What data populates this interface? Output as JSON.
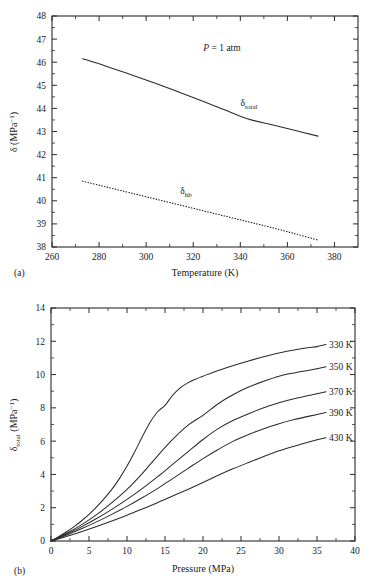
{
  "figure": {
    "background": "#ffffff",
    "ink_color": "#2b2b2b"
  },
  "panel_a": {
    "tag": "(a)",
    "annotation": "= 1 atm",
    "annotation_symbol": "P",
    "xlabel": "Temperature (K)",
    "ylabel_main": "δ (MPa",
    "ylabel_sup": "−1",
    "ylabel_close": ")",
    "xticks": [
      "260",
      "280",
      "300",
      "320",
      "340",
      "360",
      "380"
    ],
    "yticks": [
      "38",
      "39",
      "40",
      "41",
      "42",
      "43",
      "44",
      "45",
      "46",
      "47",
      "48"
    ],
    "curve_labels": [
      {
        "base": "δ",
        "sub": "total"
      },
      {
        "base": "δ",
        "sub": "hb"
      }
    ]
  },
  "panel_b": {
    "tag": "(b)",
    "xlabel": "Pressure (MPa)",
    "ylabel_base": "δ",
    "ylabel_sub": "total",
    "ylabel_unit": " (MPa",
    "ylabel_sup": "−1",
    "ylabel_close": ")",
    "xticks": [
      "0",
      "5",
      "10",
      "15",
      "20",
      "25",
      "30",
      "35",
      "40"
    ],
    "yticks": [
      "0",
      "2",
      "4",
      "6",
      "8",
      "10",
      "12",
      "14"
    ],
    "series_labels": [
      "330 K",
      "350 K",
      "370 K",
      "390 K",
      "430 K"
    ]
  },
  "chart_data": [
    {
      "type": "line",
      "panel": "a",
      "title": "",
      "xlabel": "Temperature (K)",
      "ylabel": "δ (MPa⁻¹)",
      "xlim": [
        260,
        390
      ],
      "ylim": [
        38,
        48
      ],
      "xticks": [
        260,
        280,
        300,
        320,
        340,
        360,
        380
      ],
      "yticks": [
        38,
        39,
        40,
        41,
        42,
        43,
        44,
        45,
        46,
        47,
        48
      ],
      "grid": false,
      "legend": "inline-labels",
      "annotations": [
        {
          "text": "P = 1 atm",
          "x": 330,
          "y": 46.6
        }
      ],
      "series": [
        {
          "name": "δ_total",
          "style": "solid",
          "x": [
            273,
            283,
            293,
            303,
            313,
            323,
            333,
            343,
            353,
            363,
            373
          ],
          "y": [
            46.15,
            45.83,
            45.48,
            45.12,
            44.74,
            44.35,
            43.95,
            43.55,
            43.3,
            43.05,
            42.8
          ]
        },
        {
          "name": "δ_hb",
          "style": "dotted",
          "x": [
            273,
            283,
            293,
            303,
            313,
            323,
            333,
            343,
            353,
            363,
            373
          ],
          "y": [
            40.85,
            40.6,
            40.35,
            40.1,
            39.85,
            39.6,
            39.35,
            39.1,
            38.85,
            38.58,
            38.3
          ]
        }
      ]
    },
    {
      "type": "line",
      "panel": "b",
      "title": "",
      "xlabel": "Pressure (MPa)",
      "ylabel": "δ_total (MPa⁻¹)",
      "xlim": [
        0,
        40
      ],
      "ylim": [
        0,
        14
      ],
      "xticks": [
        0,
        5,
        10,
        15,
        20,
        25,
        30,
        35,
        40
      ],
      "yticks": [
        0,
        2,
        4,
        6,
        8,
        10,
        12,
        14
      ],
      "grid": false,
      "legend": "inline-labels-right",
      "series": [
        {
          "name": "330 K",
          "style": "solid",
          "x": [
            0,
            1,
            2,
            3,
            4,
            5,
            6,
            7,
            8,
            9,
            10,
            11,
            12,
            13,
            14,
            15,
            16,
            17,
            18,
            19,
            20,
            22,
            24,
            26,
            28,
            30,
            32,
            35
          ],
          "y": [
            0,
            0.26,
            0.54,
            0.85,
            1.2,
            1.6,
            2.05,
            2.55,
            3.1,
            3.75,
            4.5,
            5.35,
            6.25,
            7.1,
            7.75,
            8.15,
            8.75,
            9.2,
            9.5,
            9.72,
            9.9,
            10.25,
            10.55,
            10.82,
            11.07,
            11.3,
            11.48,
            11.68
          ]
        },
        {
          "name": "350 K",
          "style": "solid",
          "x": [
            0,
            2,
            4,
            6,
            8,
            10,
            12,
            14,
            16,
            18,
            20,
            22,
            24,
            26,
            28,
            30,
            32,
            35
          ],
          "y": [
            0,
            0.45,
            0.97,
            1.58,
            2.3,
            3.1,
            4.05,
            5.1,
            6.1,
            6.95,
            7.55,
            8.25,
            8.8,
            9.25,
            9.6,
            9.9,
            10.1,
            10.35
          ]
        },
        {
          "name": "370 K",
          "style": "solid",
          "x": [
            0,
            2,
            4,
            6,
            8,
            10,
            12,
            14,
            16,
            18,
            20,
            22,
            24,
            26,
            28,
            30,
            32,
            35
          ],
          "y": [
            0,
            0.4,
            0.85,
            1.35,
            1.9,
            2.5,
            3.15,
            3.85,
            4.6,
            5.35,
            6.1,
            6.75,
            7.25,
            7.65,
            8.0,
            8.3,
            8.55,
            8.85
          ]
        },
        {
          "name": "390 K",
          "style": "solid",
          "x": [
            0,
            2,
            4,
            6,
            8,
            10,
            12,
            14,
            16,
            18,
            20,
            22,
            24,
            26,
            28,
            30,
            32,
            35
          ],
          "y": [
            0,
            0.35,
            0.73,
            1.15,
            1.6,
            2.08,
            2.6,
            3.15,
            3.75,
            4.35,
            4.95,
            5.5,
            6.0,
            6.4,
            6.75,
            7.05,
            7.3,
            7.6
          ]
        },
        {
          "name": "430 K",
          "style": "solid",
          "x": [
            0,
            2,
            4,
            6,
            8,
            10,
            12,
            14,
            16,
            18,
            20,
            22,
            24,
            26,
            28,
            30,
            32,
            35
          ],
          "y": [
            0,
            0.27,
            0.56,
            0.87,
            1.2,
            1.55,
            1.92,
            2.3,
            2.7,
            3.1,
            3.52,
            3.95,
            4.35,
            4.72,
            5.08,
            5.42,
            5.7,
            6.08
          ]
        }
      ]
    }
  ]
}
